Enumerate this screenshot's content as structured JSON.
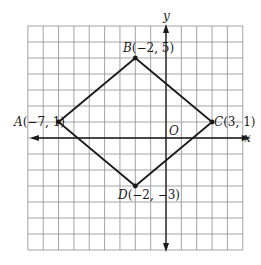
{
  "diagram": {
    "type": "coordinate-plane",
    "grid": {
      "x_min": -9,
      "x_max": 5,
      "y_min": -7,
      "y_max": 7,
      "line_color": "#9a9a9a"
    },
    "axes": {
      "x_label": "x",
      "y_label": "y",
      "origin_label": "O",
      "color": "#1a1a1a"
    },
    "shape_color": "#1a1a1a",
    "points": [
      {
        "id": "A",
        "name": "A",
        "coords": "(−7, 1)",
        "x": -7,
        "y": 1
      },
      {
        "id": "B",
        "name": "B",
        "coords": "(−2, 5)",
        "x": -2,
        "y": 5
      },
      {
        "id": "C",
        "name": "C",
        "coords": "(3, 1)",
        "x": 3,
        "y": 1
      },
      {
        "id": "D",
        "name": "D",
        "coords": "(−2, −3)",
        "x": -2,
        "y": -3
      }
    ],
    "polygon_order": [
      "A",
      "B",
      "C",
      "D"
    ]
  }
}
